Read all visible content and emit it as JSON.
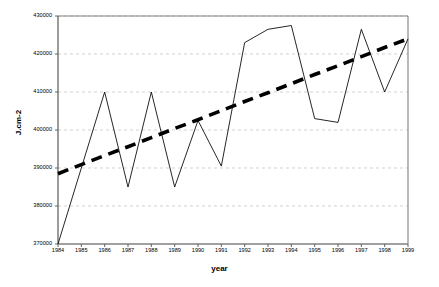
{
  "chart_data": {
    "type": "line",
    "title": "",
    "xlabel": "year",
    "ylabel": "J.cm-2",
    "xlim": [
      1984,
      1999
    ],
    "ylim": [
      370000,
      430000
    ],
    "ytick_values": [
      370000,
      380000,
      390000,
      400000,
      410000,
      420000,
      430000
    ],
    "ytick_labels": [
      "370000",
      "380000",
      "390000",
      "400000",
      "410000",
      "420000",
      "430000"
    ],
    "xtick_values": [
      1984,
      1985,
      1986,
      1987,
      1988,
      1989,
      1990,
      1991,
      1992,
      1993,
      1994,
      1995,
      1996,
      1997,
      1998,
      1999
    ],
    "xtick_labels": [
      "1984",
      "1985",
      "1986",
      "1987",
      "1988",
      "1989",
      "1990",
      "1991",
      "1992",
      "1993",
      "1994",
      "1995",
      "1996",
      "1997",
      "1998",
      "1999"
    ],
    "grid": "horizontal-dashed",
    "legend": "none",
    "categories": [
      1984,
      1985,
      1986,
      1987,
      1988,
      1989,
      1990,
      1991,
      1992,
      1993,
      1994,
      1995,
      1996,
      1997,
      1998,
      1999
    ],
    "series": [
      {
        "name": "annual radiation",
        "style": "solid-thin",
        "color": "#000000",
        "values": [
          370000,
          390000,
          410000,
          385000,
          410000,
          385000,
          402500,
          390500,
          423000,
          426500,
          427500,
          403000,
          402000,
          426500,
          410000,
          424000
        ]
      },
      {
        "name": "linear trend",
        "style": "dashed-thick",
        "color": "#000000",
        "values": [
          388500,
          390900,
          393300,
          395600,
          398000,
          400400,
          402700,
          405100,
          407500,
          409800,
          412200,
          414600,
          416900,
          419300,
          421700,
          424000
        ]
      }
    ],
    "plot_area": {
      "left": 58,
      "top": 16,
      "right": 408,
      "bottom": 244
    },
    "axis_color": "#808080",
    "grid_color": "#bfbfbf",
    "background": "#ffffff"
  }
}
